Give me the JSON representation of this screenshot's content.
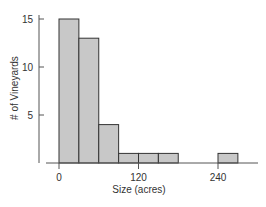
{
  "chart_data": {
    "type": "bar",
    "subtype": "histogram",
    "title": "",
    "xlabel": "Size (acres)",
    "ylabel": "# of Vineyards",
    "bin_width": 30,
    "bins": [
      {
        "start": 0,
        "end": 30,
        "count": 15
      },
      {
        "start": 30,
        "end": 60,
        "count": 13
      },
      {
        "start": 60,
        "end": 90,
        "count": 4
      },
      {
        "start": 90,
        "end": 120,
        "count": 1
      },
      {
        "start": 120,
        "end": 150,
        "count": 1
      },
      {
        "start": 150,
        "end": 180,
        "count": 1
      },
      {
        "start": 180,
        "end": 210,
        "count": 0
      },
      {
        "start": 210,
        "end": 240,
        "count": 0
      },
      {
        "start": 240,
        "end": 270,
        "count": 1
      }
    ],
    "categories": [
      "0-30",
      "30-60",
      "60-90",
      "90-120",
      "120-150",
      "150-180",
      "180-210",
      "210-240",
      "240-270"
    ],
    "values": [
      15,
      13,
      4,
      1,
      1,
      1,
      0,
      0,
      1
    ],
    "x_ticks": [
      0,
      120,
      240
    ],
    "y_ticks": [
      5,
      10,
      15
    ],
    "xlim": [
      -30,
      300
    ],
    "ylim": [
      0,
      16
    ],
    "grid": false,
    "legend": null,
    "colors": {
      "bar_fill": "#c8c8c8",
      "bar_edge": "#333333",
      "axis": "#555555"
    }
  }
}
